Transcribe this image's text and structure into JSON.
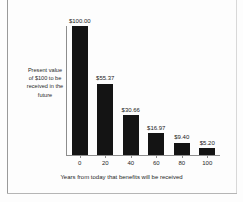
{
  "chart_data": {
    "type": "bar",
    "title": "",
    "categories": [
      "0",
      "20",
      "40",
      "60",
      "80",
      "100"
    ],
    "values": [
      100.0,
      55.37,
      30.66,
      16.97,
      9.4,
      5.2
    ],
    "data_labels": [
      "$100.00",
      "$55.37",
      "$30.66",
      "$16.97",
      "$9.40",
      "$5.20"
    ],
    "xlabel": "Years from today that benefits will be received",
    "ylabel": "Present value of $100 to be received in the future",
    "ylabel_lines": [
      "Present value",
      "of $100 to be",
      "received in the",
      "future"
    ],
    "xlim": [
      -10,
      110
    ],
    "ylim": [
      0,
      100
    ],
    "grid": false,
    "legend": false,
    "bar_color": "#141414",
    "axis_color": "#8d8d8d",
    "background_color": "#fdfdfd",
    "text_color": "#1f1f1f"
  }
}
